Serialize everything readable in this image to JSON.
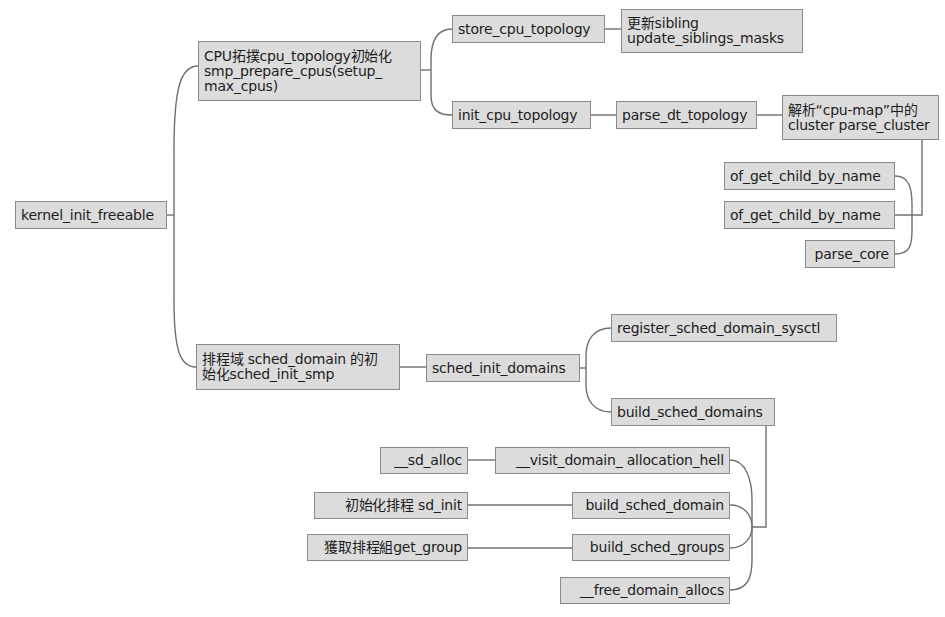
{
  "diagram": {
    "type": "mind-map",
    "style": {
      "node_fill": "#dcdcdc",
      "node_border": "#8a8a8a",
      "edge_color": "#707070",
      "text_color": "#1c1c1c"
    },
    "nodes": {
      "root": {
        "label": "kernel_init_freeable"
      },
      "cpu_topology_init": {
        "label": "CPU拓撲cpu_topology初始化\nsmp_prepare_cpus(setup_\nmax_cpus)"
      },
      "store_cpu_topology": {
        "label": "store_cpu_topology"
      },
      "update_siblings": {
        "label": "更新sibling\nupdate_siblings_masks"
      },
      "init_cpu_topology": {
        "label": "init_cpu_topology"
      },
      "parse_dt_topology": {
        "label": "parse_dt_topology"
      },
      "parse_cluster": {
        "label": "解析“cpu-map”中的\ncluster parse_cluster"
      },
      "of_get_child_by_name_1": {
        "label": "of_get_child_by_name"
      },
      "of_get_child_by_name_2": {
        "label": "of_get_child_by_name"
      },
      "parse_core": {
        "label": "parse_core"
      },
      "sched_domain_init": {
        "label": "排程域 sched_domain 的初\n始化sched_init_smp"
      },
      "sched_init_domains": {
        "label": "sched_init_domains"
      },
      "register_sched_domain_sysctl": {
        "label": "register_sched_domain_sysctl"
      },
      "build_sched_domains": {
        "label": "build_sched_domains"
      },
      "visit_domain_allocation_hell": {
        "label": "__visit_domain_ allocation_hell"
      },
      "sd_alloc": {
        "label": "__sd_alloc"
      },
      "build_sched_domain": {
        "label": "build_sched_domain"
      },
      "sd_init": {
        "label": "初始化排程 sd_init"
      },
      "build_sched_groups": {
        "label": "build_sched_groups"
      },
      "get_group": {
        "label": "獲取排程組get_group"
      },
      "free_domain_allocs": {
        "label": "__free_domain_allocs"
      }
    },
    "edges": [
      [
        "root",
        "cpu_topology_init"
      ],
      [
        "root",
        "sched_domain_init"
      ],
      [
        "cpu_topology_init",
        "store_cpu_topology"
      ],
      [
        "cpu_topology_init",
        "init_cpu_topology"
      ],
      [
        "store_cpu_topology",
        "update_siblings"
      ],
      [
        "init_cpu_topology",
        "parse_dt_topology"
      ],
      [
        "parse_dt_topology",
        "parse_cluster"
      ],
      [
        "parse_cluster",
        "of_get_child_by_name_1"
      ],
      [
        "parse_cluster",
        "of_get_child_by_name_2"
      ],
      [
        "parse_cluster",
        "parse_core"
      ],
      [
        "sched_domain_init",
        "sched_init_domains"
      ],
      [
        "sched_init_domains",
        "register_sched_domain_sysctl"
      ],
      [
        "sched_init_domains",
        "build_sched_domains"
      ],
      [
        "build_sched_domains",
        "visit_domain_allocation_hell"
      ],
      [
        "build_sched_domains",
        "build_sched_domain"
      ],
      [
        "build_sched_domains",
        "build_sched_groups"
      ],
      [
        "build_sched_domains",
        "free_domain_allocs"
      ],
      [
        "visit_domain_allocation_hell",
        "sd_alloc"
      ],
      [
        "build_sched_domain",
        "sd_init"
      ],
      [
        "build_sched_groups",
        "get_group"
      ]
    ]
  }
}
